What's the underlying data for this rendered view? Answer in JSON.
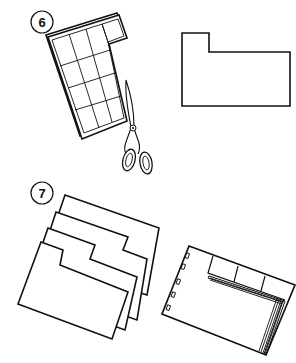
{
  "diagram": {
    "type": "instructional-illustration",
    "colors": {
      "ink": "#111111",
      "background": "#ffffff"
    },
    "steps": [
      {
        "number": "6",
        "description": "Cut stacked grid sheets into a tabbed shape with scissors",
        "elements": [
          "step-badge",
          "grid-sheet-stack",
          "scissors-icon",
          "cut-tab-shape"
        ]
      },
      {
        "number": "7",
        "description": "Stack staggered tabbed dividers and bind them into a file",
        "elements": [
          "step-badge",
          "staggered-dividers",
          "bound-tabbed-file"
        ]
      }
    ]
  }
}
